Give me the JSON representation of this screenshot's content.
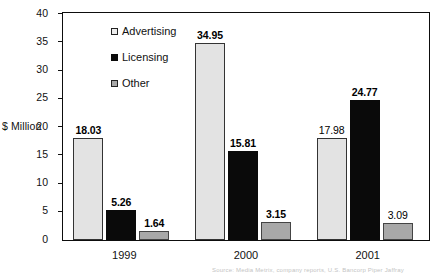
{
  "chart_data": {
    "type": "bar",
    "title": "",
    "subtitle": "",
    "xlabel": "",
    "ylabel": "$ Million",
    "ylim": [
      0,
      40
    ],
    "ytick_step": 5,
    "yticks": [
      "0",
      "5",
      "10",
      "15",
      "20",
      "25",
      "30",
      "35",
      "40"
    ],
    "grid": false,
    "legend_position": "inside-top-left",
    "categories": [
      "1999",
      "2000",
      "2001"
    ],
    "series": [
      {
        "name": "Advertising",
        "color": "#e3e3e3",
        "values": [
          18.03,
          34.95,
          17.98
        ],
        "labels": [
          "18.03",
          "34.95",
          "17.98"
        ],
        "label_bold": [
          true,
          true,
          false
        ]
      },
      {
        "name": "Licensing",
        "color": "#0a0a0a",
        "values": [
          5.26,
          15.81,
          24.77
        ],
        "labels": [
          "5.26",
          "15.81",
          "24.77"
        ],
        "label_bold": [
          true,
          true,
          true
        ]
      },
      {
        "name": "Other",
        "color": "#a8a8a8",
        "values": [
          1.64,
          3.15,
          3.09
        ],
        "labels": [
          "1.64",
          "3.15",
          "3.09"
        ],
        "label_bold": [
          true,
          true,
          false
        ]
      }
    ]
  },
  "axis": {
    "y_title": "$ Million"
  },
  "legend": {
    "items": [
      {
        "label": "Advertising"
      },
      {
        "label": "Licensing"
      },
      {
        "label": "Other"
      }
    ]
  },
  "footer": {
    "source_text": "Source: Media Metrix, company reports, U.S. Bancorp Piper Jaffray"
  }
}
